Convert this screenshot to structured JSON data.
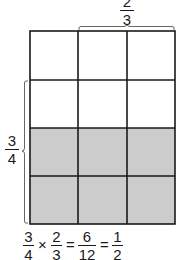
{
  "diagram": {
    "grid": {
      "rows": 4,
      "cols": 3,
      "shaded_rows": [
        3,
        4
      ],
      "shaded_color": "#cccccc",
      "line_color": "#1a1a1a",
      "unshaded_color": "#ffffff"
    },
    "top_label": {
      "numerator": "2",
      "denominator": "3",
      "brace_spans_columns": [
        2,
        3
      ]
    },
    "left_label": {
      "numerator": "3",
      "denominator": "4",
      "brace_spans_rows": [
        2,
        3,
        4
      ]
    },
    "equation": {
      "terms": [
        {
          "numerator": "3",
          "denominator": "4"
        },
        {
          "numerator": "2",
          "denominator": "3"
        },
        {
          "numerator": "6",
          "denominator": "12"
        },
        {
          "numerator": "1",
          "denominator": "2"
        }
      ],
      "operators": [
        "×",
        "=",
        "="
      ]
    }
  }
}
